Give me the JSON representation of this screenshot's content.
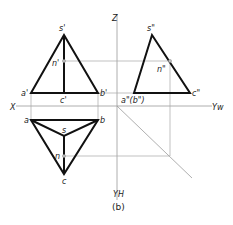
{
  "figure": {
    "caption": "(b)",
    "axes": {
      "z_label": "Z",
      "x_label": "X",
      "yw_label": "Yw",
      "yh_label": "YH"
    },
    "front_view": {
      "labels": {
        "s": "s'",
        "n": "n'",
        "a": "a'",
        "b": "b'",
        "c": "c'"
      }
    },
    "side_view": {
      "labels": {
        "s": "s\"",
        "n": "n\"",
        "ab": "a\"(b\")",
        "c": "c\""
      }
    },
    "top_view": {
      "labels": {
        "a": "a",
        "b": "b",
        "s": "s",
        "n": "n",
        "c": "c"
      }
    },
    "colors": {
      "edge": "#111111",
      "projection_line": "#a8a8a8",
      "axis": "#9a9a9a",
      "background": "#ffffff"
    }
  }
}
